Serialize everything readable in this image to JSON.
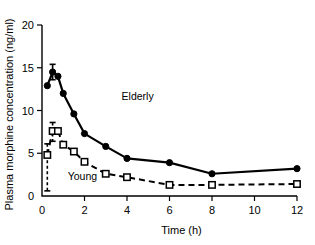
{
  "chart_data": {
    "type": "line",
    "title": "",
    "xlabel": "Time (h)",
    "ylabel": "Plasma morphine concentration (ng/ml)",
    "xlim": [
      0,
      12
    ],
    "ylim": [
      0,
      20
    ],
    "xticks": [
      0,
      2,
      4,
      6,
      8,
      10,
      12
    ],
    "yticks": [
      0,
      5,
      10,
      15,
      20
    ],
    "xtick_labels": [
      "0",
      "2",
      "4",
      "6",
      "8",
      "10",
      "12"
    ],
    "ytick_labels": [
      "0",
      "5",
      "10",
      "15",
      "20"
    ],
    "grid": false,
    "legend": "inline-annotations",
    "series": [
      {
        "name": "Elderly",
        "marker": "filled-circle",
        "line_style": "solid",
        "color": "#000000",
        "label_position": {
          "x": 4.5,
          "y": 11.2
        },
        "x": [
          0.25,
          0.5,
          0.75,
          1.0,
          1.5,
          2.0,
          3.0,
          4.0,
          6.0,
          8.0,
          12.0
        ],
        "values": [
          12.9,
          14.5,
          14.0,
          12.0,
          9.6,
          7.3,
          5.8,
          4.4,
          3.9,
          2.6,
          3.2
        ],
        "error_bars": [
          {
            "x": 0.5,
            "low": 13.6,
            "high": 15.4
          }
        ]
      },
      {
        "name": "Young",
        "marker": "open-square",
        "line_style": "dashed",
        "color": "#000000",
        "label_position": {
          "x": 1.9,
          "y": 1.9
        },
        "x": [
          0.25,
          0.5,
          0.75,
          1.0,
          1.5,
          2.0,
          3.0,
          4.0,
          6.0,
          8.0,
          12.0
        ],
        "values": [
          4.8,
          7.6,
          7.6,
          6.0,
          5.2,
          4.0,
          2.6,
          2.2,
          1.3,
          1.3,
          1.4
        ],
        "error_bars": [
          {
            "x": 0.25,
            "low": 0.6,
            "high": 6.1
          },
          {
            "x": 0.5,
            "low": 6.4,
            "high": 8.6
          }
        ]
      }
    ],
    "annotations": [
      {
        "text": "Elderly",
        "x": 4.5,
        "y": 11.2
      },
      {
        "text": "Young",
        "x": 1.9,
        "y": 1.9
      }
    ]
  },
  "figure": {
    "ylabel": "Plasma morphine concentration (ng/ml)",
    "xlabel": "Time (h)",
    "series_label_elderly": "Elderly",
    "series_label_young": "Young"
  }
}
